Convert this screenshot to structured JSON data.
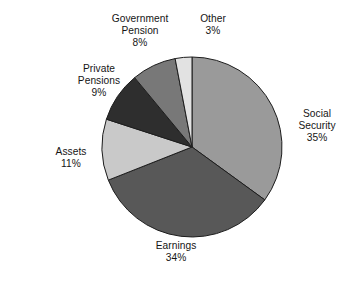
{
  "chart_data": {
    "type": "pie",
    "title": "",
    "subtitle": "",
    "xlabel": "",
    "ylabel": "",
    "legend_position": "none",
    "grid": false,
    "labels_outside": true,
    "start_angle_deg": 0,
    "direction": "clockwise",
    "categories": [
      "Social Security",
      "Earnings",
      "Assets",
      "Private Pensions",
      "Government Pension",
      "Other"
    ],
    "values": [
      35,
      34,
      11,
      9,
      8,
      3
    ],
    "value_suffix": "%",
    "colors": [
      "#9a9a9a",
      "#585858",
      "#c9c9c9",
      "#2e2e2e",
      "#787878",
      "#e2e2e2"
    ],
    "slices": [
      {
        "name": "Social Security",
        "label_line1": "Social",
        "label_line2": "Security",
        "value": 35,
        "value_text": "35%",
        "color": "#9a9a9a"
      },
      {
        "name": "Earnings",
        "label_line1": "Earnings",
        "label_line2": "",
        "value": 34,
        "value_text": "34%",
        "color": "#585858"
      },
      {
        "name": "Assets",
        "label_line1": "Assets",
        "label_line2": "",
        "value": 11,
        "value_text": "11%",
        "color": "#c9c9c9"
      },
      {
        "name": "Private Pensions",
        "label_line1": "Private",
        "label_line2": "Pensions",
        "value": 9,
        "value_text": "9%",
        "color": "#2e2e2e"
      },
      {
        "name": "Government Pension",
        "label_line1": "Government",
        "label_line2": "Pension",
        "value": 8,
        "value_text": "8%",
        "color": "#787878"
      },
      {
        "name": "Other",
        "label_line1": "Other",
        "label_line2": "",
        "value": 3,
        "value_text": "3%",
        "color": "#e2e2e2"
      }
    ]
  },
  "geometry": {
    "center_x": 192,
    "center_y": 147,
    "radius": 90,
    "stroke_color": "#1d1d1d",
    "stroke_width": 1
  },
  "labels": {
    "government_pension": {
      "line1": "Government",
      "line2": "Pension",
      "value": "8%"
    },
    "other": {
      "line1": "Other",
      "line2": "",
      "value": "3%"
    },
    "private_pensions": {
      "line1": "Private",
      "line2": "Pensions",
      "value": "9%"
    },
    "assets": {
      "line1": "Assets",
      "line2": "",
      "value": "11%"
    },
    "earnings": {
      "line1": "Earnings",
      "line2": "",
      "value": "34%"
    },
    "social_security": {
      "line1": "Social",
      "line2": "Security",
      "value": "35%"
    }
  }
}
